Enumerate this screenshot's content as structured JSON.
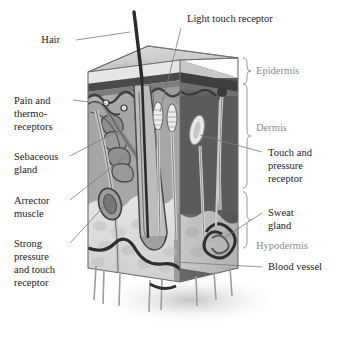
{
  "figure": {
    "type": "anatomical-diagram"
  },
  "colors": {
    "label_text": "#1b1b1b",
    "layer_label_text": "#8d8d8d",
    "leader_line": "#7a7a7a",
    "brace": "#9a9a9a",
    "top_face": "#d0d0d0",
    "front_face": "#a8a8a8",
    "side_face": "#5e5e5e",
    "epidermis_band": "#4a4a4a",
    "hypodermis_fat": "#dcdcdc",
    "hair_dark": "#2b2b2b",
    "blood_vessel": "#2e2e2e",
    "receptor_light": "#efefef",
    "background": "#ffffff"
  },
  "labels": {
    "hair": "Hair",
    "light_touch_receptor": "Light touch receptor",
    "pain_and_thermoreceptors_line1": "Pain and",
    "pain_and_thermoreceptors_line2": "thermo-",
    "pain_and_thermoreceptors_line3": "receptors",
    "sebaceous_gland_line1": "Sebaceous",
    "sebaceous_gland_line2": "gland",
    "arrector_muscle_line1": "Arrector",
    "arrector_muscle_line2": "muscle",
    "strong_pressure_line1": "Strong",
    "strong_pressure_line2": "pressure",
    "strong_pressure_line3": "and touch",
    "strong_pressure_line4": "receptor",
    "touch_and_pressure_line1": "Touch and",
    "touch_and_pressure_line2": "pressure",
    "touch_and_pressure_line3": "receptor",
    "sweat_gland_line1": "Sweat",
    "sweat_gland_line2": "gland",
    "blood_vessel": "Blood vessel"
  },
  "layers": {
    "epidermis": "Epidermis",
    "dermis": "Dermis",
    "hypodermis": "Hypodermis"
  }
}
